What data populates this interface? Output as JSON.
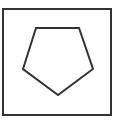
{
  "diagram": {
    "frame": {
      "shape": "square",
      "x": 3,
      "y": 9,
      "width": 108,
      "height": 106,
      "stroke": "#333333",
      "stroke_width": 2
    },
    "shape": {
      "type": "pentagon",
      "orientation": "point-down",
      "points": "36,28 79,28 93,69 58,95 23,69",
      "stroke": "#333333",
      "stroke_width": 2,
      "fill": "none"
    }
  }
}
